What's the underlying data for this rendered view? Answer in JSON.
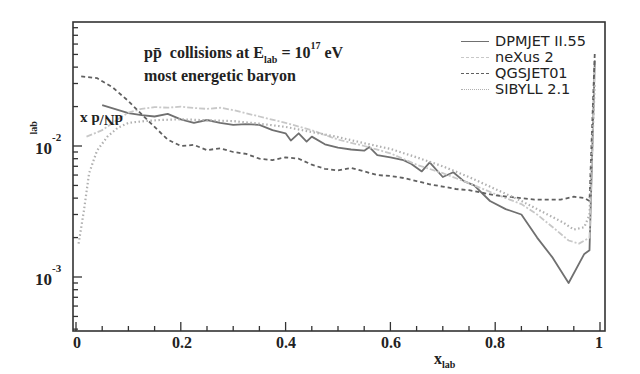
{
  "chart_data": {
    "type": "line",
    "title": "",
    "annotation_line1": "collisions at",
    "annotation_prefix": "pp̄",
    "annotation_energy_symbol": "E",
    "annotation_energy_sub": "lab",
    "annotation_equals": "= 10",
    "annotation_exponent": "17",
    "annotation_unit": "eV",
    "annotation_line2": "most energetic baryon",
    "xlabel": "x",
    "xlabel_sub": "lab",
    "ylabel": "dN/d x",
    "ylabel_sub": "lab",
    "xlim": [
      0,
      1
    ],
    "ylim": [
      0.0003,
      0.058
    ],
    "yscale": "log",
    "grid": false,
    "legend_position": "top-right",
    "x_ticks": [
      "0",
      "0.2",
      "0.4",
      "0.6",
      "0.8",
      "1"
    ],
    "y_ticks": [
      {
        "base": "10",
        "exp": "-2"
      },
      {
        "base": "10",
        "exp": "-3"
      }
    ],
    "series": [
      {
        "name": "DPMJET II.55",
        "style": "solid",
        "color": "#707070",
        "x": [
          0.05,
          0.1,
          0.125,
          0.15,
          0.175,
          0.2,
          0.225,
          0.25,
          0.275,
          0.3,
          0.325,
          0.35,
          0.375,
          0.4,
          0.41,
          0.425,
          0.44,
          0.45,
          0.475,
          0.5,
          0.525,
          0.55,
          0.56,
          0.575,
          0.6,
          0.625,
          0.64,
          0.66,
          0.675,
          0.7,
          0.72,
          0.74,
          0.76,
          0.79,
          0.82,
          0.85,
          0.88,
          0.91,
          0.94,
          0.97,
          0.98,
          0.99
        ],
        "y": [
          0.0205,
          0.0178,
          0.0172,
          0.0168,
          0.0176,
          0.016,
          0.015,
          0.0158,
          0.015,
          0.0145,
          0.0147,
          0.0145,
          0.0132,
          0.0125,
          0.011,
          0.0125,
          0.0108,
          0.0118,
          0.0103,
          0.0097,
          0.0094,
          0.0092,
          0.0098,
          0.0085,
          0.0082,
          0.0078,
          0.0073,
          0.0064,
          0.0075,
          0.0058,
          0.0063,
          0.0054,
          0.005,
          0.0038,
          0.0033,
          0.003,
          0.002,
          0.0014,
          0.0009,
          0.0015,
          0.0016,
          0.045
        ]
      },
      {
        "name": "neXus 2",
        "style": "dashdot",
        "color": "#c8c8c8",
        "x": [
          0.02,
          0.05,
          0.08,
          0.1,
          0.125,
          0.15,
          0.175,
          0.2,
          0.225,
          0.25,
          0.275,
          0.3,
          0.35,
          0.4,
          0.45,
          0.5,
          0.55,
          0.6,
          0.65,
          0.7,
          0.75,
          0.8,
          0.85,
          0.88,
          0.91,
          0.94,
          0.96,
          0.98,
          0.99
        ],
        "y": [
          0.0118,
          0.0132,
          0.016,
          0.018,
          0.0192,
          0.0198,
          0.0196,
          0.02,
          0.0195,
          0.0192,
          0.0196,
          0.0188,
          0.0168,
          0.015,
          0.0132,
          0.0112,
          0.01,
          0.0088,
          0.0072,
          0.0062,
          0.0052,
          0.0043,
          0.0036,
          0.003,
          0.0024,
          0.0019,
          0.0018,
          0.002,
          0.04
        ]
      },
      {
        "name": "QGSJET01",
        "style": "dashed",
        "color": "#606060",
        "x": [
          0.01,
          0.04,
          0.07,
          0.1,
          0.125,
          0.15,
          0.175,
          0.2,
          0.225,
          0.25,
          0.275,
          0.3,
          0.325,
          0.35,
          0.375,
          0.4,
          0.425,
          0.45,
          0.475,
          0.5,
          0.525,
          0.55,
          0.575,
          0.6,
          0.625,
          0.65,
          0.675,
          0.7,
          0.725,
          0.75,
          0.775,
          0.8,
          0.825,
          0.85,
          0.875,
          0.9,
          0.925,
          0.95,
          0.97,
          0.98,
          0.99
        ],
        "y": [
          0.034,
          0.033,
          0.028,
          0.022,
          0.0175,
          0.014,
          0.0112,
          0.01,
          0.0102,
          0.0093,
          0.0096,
          0.009,
          0.0087,
          0.008,
          0.0078,
          0.0082,
          0.008,
          0.0072,
          0.0067,
          0.0065,
          0.0068,
          0.0064,
          0.006,
          0.0059,
          0.0057,
          0.0054,
          0.0051,
          0.0049,
          0.0047,
          0.0046,
          0.0044,
          0.0042,
          0.0041,
          0.004,
          0.0039,
          0.0039,
          0.0039,
          0.0041,
          0.004,
          0.0038,
          0.052
        ]
      },
      {
        "name": "SIBYLL 2.1",
        "style": "dotted",
        "color": "#b0b0b0",
        "x": [
          0.005,
          0.015,
          0.025,
          0.04,
          0.06,
          0.08,
          0.1,
          0.13,
          0.16,
          0.2,
          0.25,
          0.3,
          0.35,
          0.4,
          0.45,
          0.5,
          0.55,
          0.6,
          0.65,
          0.7,
          0.75,
          0.8,
          0.85,
          0.9,
          0.93,
          0.95,
          0.97,
          0.98,
          0.99
        ],
        "y": [
          0.0018,
          0.0032,
          0.0062,
          0.0092,
          0.0118,
          0.0138,
          0.015,
          0.0155,
          0.0158,
          0.016,
          0.0157,
          0.0155,
          0.0148,
          0.014,
          0.0128,
          0.0117,
          0.0105,
          0.0095,
          0.0082,
          0.007,
          0.0058,
          0.0047,
          0.0038,
          0.003,
          0.0026,
          0.0023,
          0.0024,
          0.003,
          0.03
        ]
      }
    ]
  }
}
